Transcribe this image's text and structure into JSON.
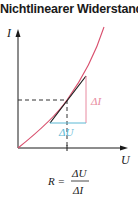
{
  "title": "Nichtlinearer Widerstand",
  "axes": {
    "y_label": "I",
    "x_label": "U"
  },
  "annotations": {
    "delta_i": "ΔI",
    "delta_u": "ΔU"
  },
  "formula": {
    "lhs": "R =",
    "numerator": "ΔU",
    "denominator": "ΔI"
  },
  "colors": {
    "curve": "#d9506e",
    "delta_i_line": "#e88aa0",
    "delta_u_line": "#5bb8d4",
    "axis": "#1a1a1a",
    "tangent": "#1a1a1a",
    "dashed": "#333333"
  }
}
